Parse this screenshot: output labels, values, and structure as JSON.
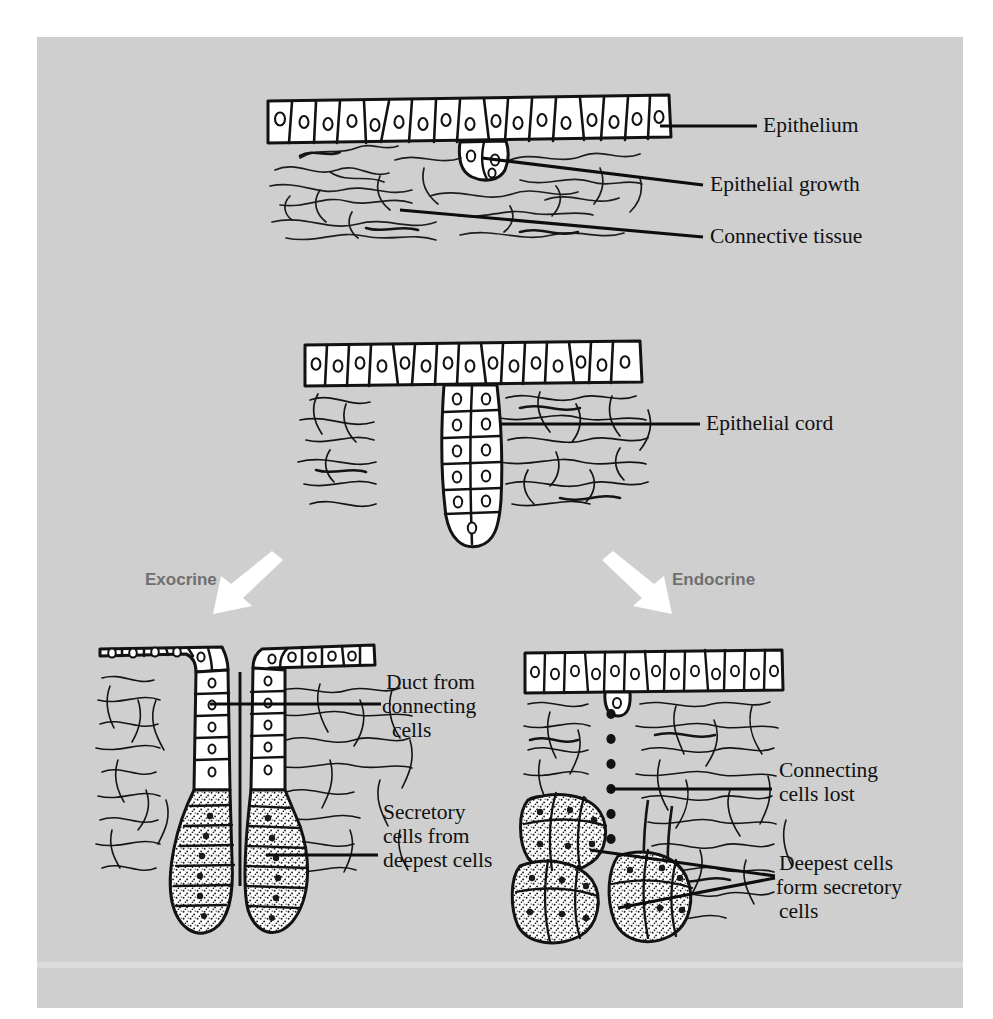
{
  "figure": {
    "background_color": "#cfcfcf",
    "page_color": "#ffffff",
    "ink_color": "#111111",
    "branch_label_color": "#6f6f6f",
    "arrow_color": "#ffffff"
  },
  "panels": {
    "top": {
      "name": "Epithelial growth stage",
      "labels": [
        {
          "id": "epithelium",
          "text": "Epithelium"
        },
        {
          "id": "epithelial-growth",
          "text": "Epithelial growth"
        },
        {
          "id": "connective-tissue",
          "text": "Connective tissue"
        }
      ]
    },
    "middle": {
      "name": "Epithelial cord stage",
      "labels": [
        {
          "id": "epithelial-cord",
          "text": "Epithelial cord"
        }
      ]
    },
    "bottom_left": {
      "name": "Exocrine gland",
      "labels": [
        {
          "id": "duct",
          "lines": [
            "Duct from",
            "connecting",
            "cells"
          ]
        },
        {
          "id": "secretory",
          "lines": [
            "Secretory",
            "cells from",
            "deepest cells"
          ]
        }
      ]
    },
    "bottom_right": {
      "name": "Endocrine gland",
      "labels": [
        {
          "id": "connecting-lost",
          "lines": [
            "Connecting",
            "cells lost"
          ]
        },
        {
          "id": "deepest-secretory",
          "lines": [
            "Deepest cells",
            "form secretory",
            "cells"
          ]
        }
      ]
    }
  },
  "branches": [
    {
      "id": "exocrine",
      "label": "Exocrine"
    },
    {
      "id": "endocrine",
      "label": "Endocrine"
    }
  ],
  "label_text": {
    "epithelium": "Epithelium",
    "epithelial_growth": "Epithelial growth",
    "connective_tissue": "Connective tissue",
    "epithelial_cord": "Epithelial cord",
    "duct_l1": "Duct from",
    "duct_l2": "connecting",
    "duct_l3": "cells",
    "secretory_l1": "Secretory",
    "secretory_l2": "cells from",
    "secretory_l3": "deepest cells",
    "connlost_l1": "Connecting",
    "connlost_l2": "cells lost",
    "deepest_l1": "Deepest cells",
    "deepest_l2": "form secretory",
    "deepest_l3": "cells",
    "exocrine": "Exocrine",
    "endocrine": "Endocrine"
  }
}
